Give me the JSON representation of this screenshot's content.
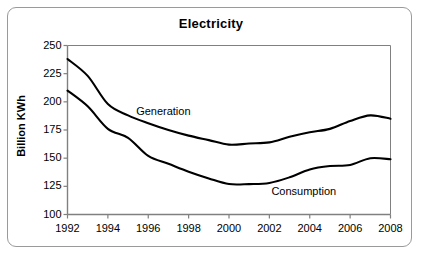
{
  "chart_data": {
    "type": "line",
    "title": "Electricity",
    "xlabel": "",
    "ylabel": "Billion KWh",
    "xlim": [
      1992,
      2008
    ],
    "ylim": [
      100,
      250
    ],
    "ytick_labels": [
      "250",
      "225",
      "200",
      "175",
      "150",
      "125",
      "100"
    ],
    "yticks": [
      250,
      225,
      200,
      175,
      150,
      125,
      100
    ],
    "xtick_labels": [
      "1992",
      "1994",
      "1996",
      "1998",
      "2000",
      "2002",
      "2004",
      "2006",
      "2008"
    ],
    "xticks": [
      1992,
      1994,
      1996,
      1998,
      2000,
      2002,
      2004,
      2006,
      2008
    ],
    "grid": false,
    "legend_position": "inline-annotation",
    "x": [
      1992,
      1993,
      1994,
      1995,
      1996,
      1997,
      1998,
      1999,
      2000,
      2001,
      2002,
      2003,
      2004,
      2005,
      2006,
      2007,
      2008
    ],
    "series": [
      {
        "name": "Generation",
        "color": "#000000",
        "values": [
          238,
          223,
          198,
          188,
          181,
          175,
          170,
          166,
          162,
          163,
          164,
          169,
          173,
          176,
          183,
          188,
          185
        ]
      },
      {
        "name": "Consumption",
        "color": "#000000",
        "values": [
          210,
          196,
          176,
          168,
          152,
          145,
          138,
          132,
          127,
          127,
          128,
          133,
          140,
          143,
          144,
          150,
          149
        ]
      }
    ],
    "annotations": [
      {
        "text": "Generation",
        "x": 1995.4,
        "y": 191
      },
      {
        "text": "Consumption",
        "x": 2002.1,
        "y": 120
      }
    ]
  },
  "figure": {
    "border_color": "#9a9a9a",
    "background": "#ffffff",
    "axis_color": "#808080",
    "line_color": "#000000"
  }
}
